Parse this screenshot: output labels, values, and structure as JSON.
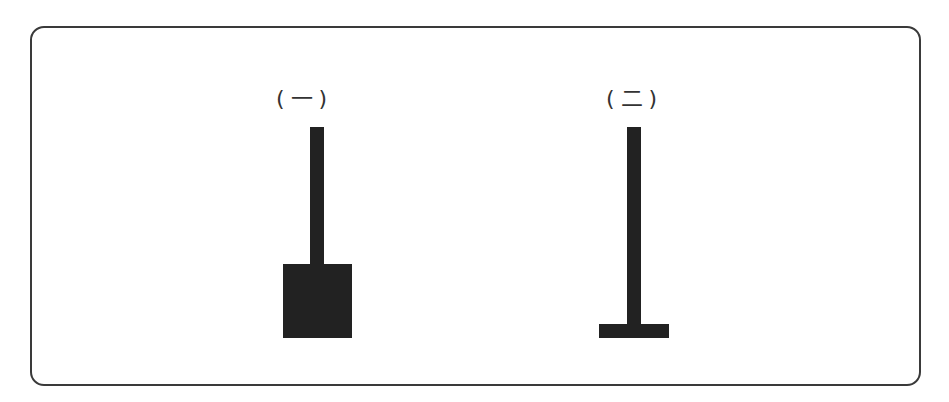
{
  "figures": [
    {
      "label": "(一)",
      "description": "vertical rod with square block at bottom"
    },
    {
      "label": "(二)",
      "description": "vertical rod with flat horizontal base"
    }
  ],
  "colors": {
    "shape": "#222222",
    "frame": "#3a3a3a",
    "text": "#333333"
  }
}
